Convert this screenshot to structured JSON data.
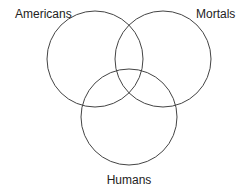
{
  "diagram": {
    "type": "venn",
    "sets": [
      {
        "name": "americans",
        "label": "Americans",
        "cx": 95,
        "cy": 59,
        "r": 48,
        "label_x": 15,
        "label_y": 18,
        "anchor": "start"
      },
      {
        "name": "mortals",
        "label": "Mortals",
        "cx": 163,
        "cy": 59,
        "r": 48,
        "label_x": 196,
        "label_y": 18,
        "anchor": "start"
      },
      {
        "name": "humans",
        "label": "Humans",
        "cx": 129,
        "cy": 117,
        "r": 48,
        "label_x": 129,
        "label_y": 184,
        "anchor": "middle"
      }
    ],
    "stroke_color": "#444444",
    "text_color": "#222222",
    "background": "#ffffff"
  }
}
